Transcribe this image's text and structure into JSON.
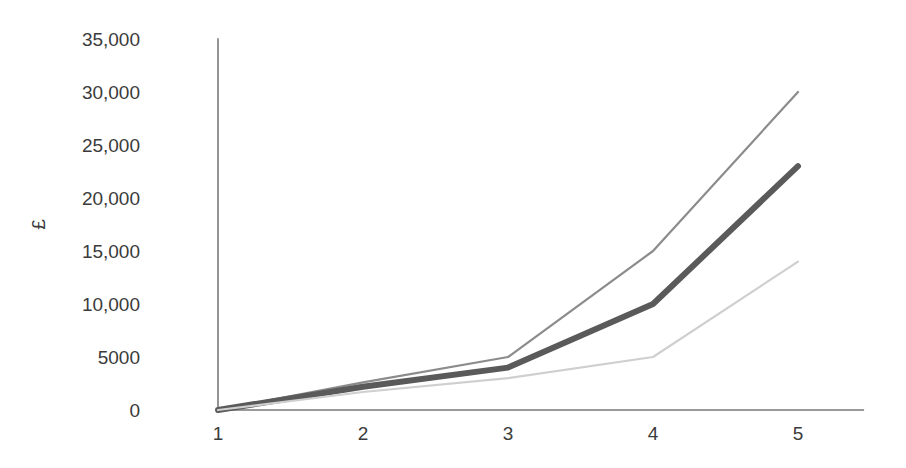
{
  "chart_data": {
    "type": "line",
    "title": "",
    "subtitle": "",
    "xlabel": "",
    "ylabel": "£",
    "x": [
      1,
      2,
      3,
      4,
      5
    ],
    "xtick_labels": [
      "1",
      "2",
      "3",
      "4",
      "5"
    ],
    "ytick_values": [
      0,
      5000,
      10000,
      15000,
      20000,
      25000,
      30000,
      35000
    ],
    "ytick_labels": [
      "0",
      "5000",
      "10,000",
      "15,000",
      "20,000",
      "25,000",
      "30,000",
      "35,000"
    ],
    "xlim": [
      0.5,
      5.45
    ],
    "ylim": [
      0,
      35000
    ],
    "grid": false,
    "legend": "none",
    "series": [
      {
        "name": "upper",
        "color": "#8c8c8c",
        "width": 2.2,
        "values": [
          0,
          2600,
          5000,
          15000,
          30000
        ]
      },
      {
        "name": "middle",
        "color": "#5a5a5a",
        "width": 6.0,
        "values": [
          0,
          2200,
          4000,
          10000,
          23000
        ]
      },
      {
        "name": "lower",
        "color": "#cfcfcf",
        "width": 2.2,
        "values": [
          0,
          1700,
          3000,
          5000,
          14000
        ]
      }
    ]
  },
  "axes": {
    "axis_color": "#7a7a7a",
    "tick_color": "#3b3b3b"
  }
}
